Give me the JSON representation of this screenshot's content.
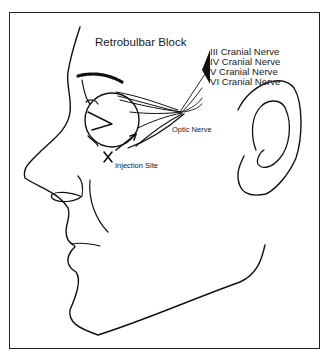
{
  "diagram": {
    "title": "Retrobulbar Block",
    "nerve_labels": [
      "III Cranial Nerve",
      "IV Cranial Nerve",
      "V Cranial Nerve",
      "VI Cranial Nerve"
    ],
    "optic_nerve_label": "Optic Nerve",
    "injection_site_label": "Injection Site",
    "line_color": "#111111",
    "background": "#ffffff"
  }
}
